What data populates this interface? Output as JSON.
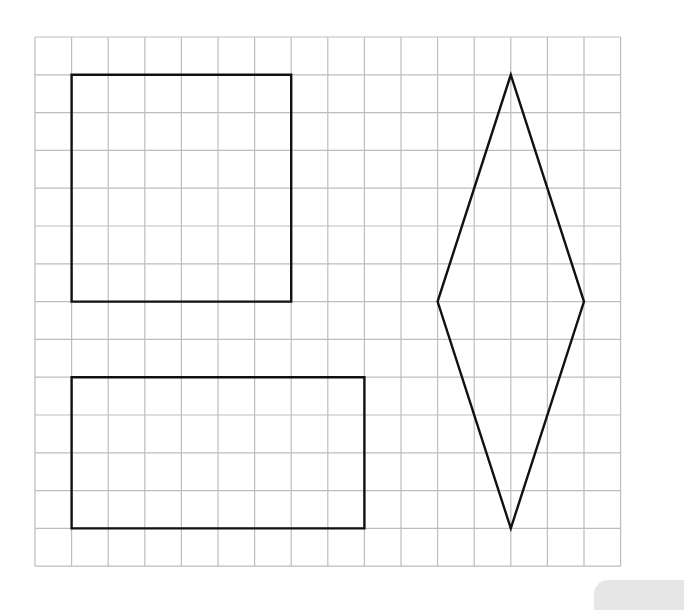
{
  "diagram": {
    "type": "grid-shapes",
    "grid": {
      "cols": 16,
      "rows": 14,
      "origin_x": 35,
      "origin_y": 37,
      "cell_w": 36.6,
      "cell_h": 37.8,
      "line_color": "#bdbdbd",
      "line_width": 1.2
    },
    "shape_style": {
      "stroke": "#111111",
      "stroke_width": 2.4
    },
    "shapes": [
      {
        "name": "square",
        "kind": "polygon",
        "points": [
          [
            1,
            1
          ],
          [
            7,
            1
          ],
          [
            7,
            7
          ],
          [
            1,
            7
          ]
        ]
      },
      {
        "name": "rectangle",
        "kind": "polygon",
        "points": [
          [
            1,
            9
          ],
          [
            9,
            9
          ],
          [
            9,
            13
          ],
          [
            1,
            13
          ]
        ]
      },
      {
        "name": "rhombus",
        "kind": "polygon",
        "points": [
          [
            13,
            1
          ],
          [
            15,
            7
          ],
          [
            13,
            13
          ],
          [
            11,
            7
          ]
        ]
      }
    ]
  },
  "colors": {
    "background": "#ffffff",
    "corner_tab": "#e6e6e6"
  }
}
